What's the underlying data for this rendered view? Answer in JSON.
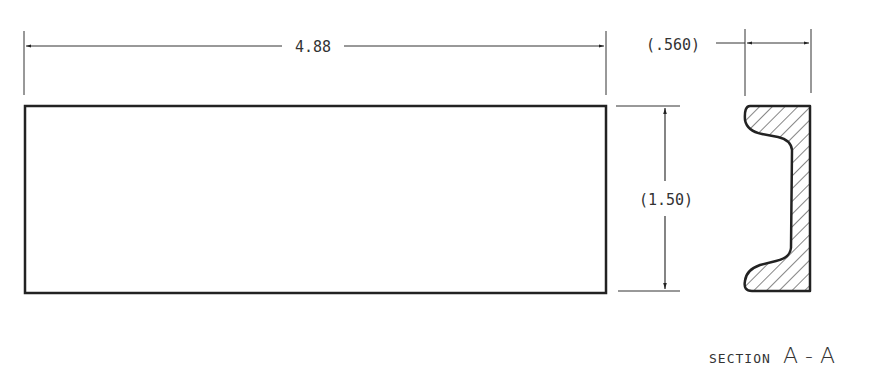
{
  "drawing": {
    "length_dimension": "4.88",
    "height_dimension": "(1.50)",
    "section_width_dimension": "(.560)",
    "section_label_prefix": "SECTION",
    "section_label_id": "A - A"
  },
  "colors": {
    "line": "#222222",
    "text": "#333333",
    "background": "#ffffff"
  }
}
